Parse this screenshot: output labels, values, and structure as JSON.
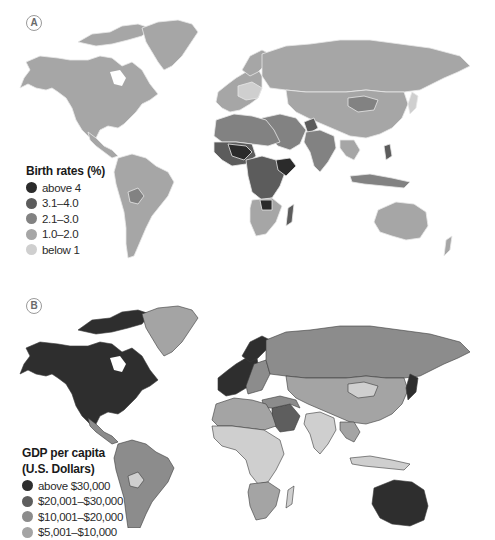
{
  "panels": [
    {
      "label": "A",
      "legend": {
        "title": "Birth rates (%)",
        "items": [
          {
            "label": "above 4",
            "color": "#2b2b2b"
          },
          {
            "label": "3.1–4.0",
            "color": "#5c5c5c"
          },
          {
            "label": "2.1–3.0",
            "color": "#828282"
          },
          {
            "label": "1.0–2.0",
            "color": "#a6a6a6"
          },
          {
            "label": "below 1",
            "color": "#cfcfcf"
          }
        ]
      }
    },
    {
      "label": "B",
      "legend": {
        "title_line1": "GDP per capita",
        "title_line2": "(U.S. Dollars)",
        "items": [
          {
            "label": "above $30,000",
            "color": "#2e2e2e"
          },
          {
            "label": "$20,001–$30,000",
            "color": "#5e5e5e"
          },
          {
            "label": "$10,001–$20,000",
            "color": "#8c8c8c"
          },
          {
            "label": "$5,001–$10,000",
            "color": "#a4a4a4"
          }
        ]
      }
    }
  ],
  "colors": {
    "background": "#ffffff",
    "border_light": "#e6e6e6",
    "border_dark": "#3a3a3a"
  }
}
